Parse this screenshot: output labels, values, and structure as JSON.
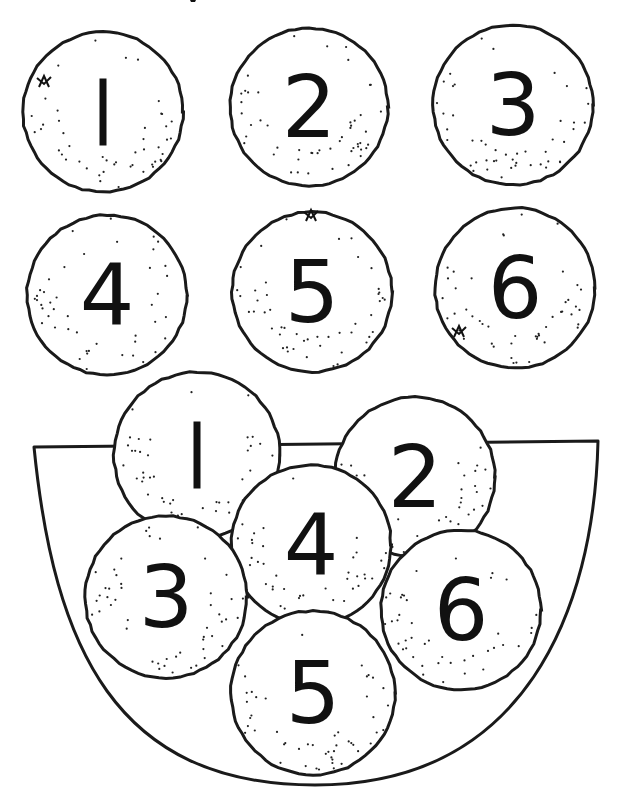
{
  "worksheet": {
    "ink_color": "#111111",
    "paper_color": "#ffffff",
    "title_fragment_visible": true
  },
  "loose_oranges": [
    {
      "number": "1",
      "cx": 103,
      "cy": 112,
      "r": 80,
      "stem": {
        "x": 44,
        "y": 82
      }
    },
    {
      "number": "2",
      "cx": 309,
      "cy": 107,
      "r": 79
    },
    {
      "number": "3",
      "cx": 513,
      "cy": 105,
      "r": 80
    },
    {
      "number": "4",
      "cx": 107,
      "cy": 295,
      "r": 80
    },
    {
      "number": "5",
      "cx": 312,
      "cy": 292,
      "r": 80,
      "stem": {
        "x": 311,
        "y": 216
      }
    },
    {
      "number": "6",
      "cx": 515,
      "cy": 288,
      "r": 80,
      "stem": {
        "x": 459,
        "y": 332
      }
    }
  ],
  "bowl": {
    "top_left": [
      34,
      447
    ],
    "top_right": [
      598,
      441
    ],
    "bottom": [
      315,
      785
    ],
    "oranges": [
      {
        "number": "1",
        "cx": 197,
        "cy": 455,
        "r": 83
      },
      {
        "number": "2",
        "cx": 415,
        "cy": 477,
        "r": 80
      },
      {
        "number": "4",
        "cx": 311,
        "cy": 545,
        "r": 80
      },
      {
        "number": "3",
        "cx": 166,
        "cy": 597,
        "r": 81
      },
      {
        "number": "6",
        "cx": 461,
        "cy": 610,
        "r": 80
      },
      {
        "number": "5",
        "cx": 313,
        "cy": 693,
        "r": 82
      }
    ]
  }
}
